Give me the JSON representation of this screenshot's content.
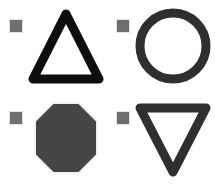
{
  "canvas": {
    "background_color": "#ffffff",
    "width": 215,
    "height": 184,
    "layout": "2x2-grid"
  },
  "palette": {
    "black": "#0d0d0d",
    "dark_gray": "#2f2f2f",
    "fill_gray": "#454545",
    "handle_gray": "#6e6e6e",
    "handle_border": "#e4e4e4",
    "shape_outline_light": "#f2f2f2"
  },
  "items": [
    {
      "id": "triangle-up",
      "icon_name": "triangle-up-outline-icon",
      "handle_name": "selection-handle",
      "label": "",
      "stroke_color": "#0d0d0d",
      "fill_color": "none",
      "stroke_width": 9,
      "sides": 3,
      "rotation_deg": 0
    },
    {
      "id": "circle",
      "icon_name": "circle-outline-icon",
      "handle_name": "selection-handle",
      "label": "",
      "stroke_color": "#2f2f2f",
      "fill_color": "none",
      "stroke_width": 9,
      "sides": 0,
      "rotation_deg": 0
    },
    {
      "id": "octagon",
      "icon_name": "octagon-filled-icon",
      "handle_name": "selection-handle",
      "label": "",
      "stroke_color": "#f2f2f2",
      "fill_color": "#454545",
      "stroke_width": 2,
      "sides": 8,
      "rotation_deg": 22.5
    },
    {
      "id": "triangle-down",
      "icon_name": "triangle-down-outline-icon",
      "handle_name": "selection-handle",
      "label": "",
      "stroke_color": "#2f2f2f",
      "fill_color": "none",
      "stroke_width": 9,
      "sides": 3,
      "rotation_deg": 180
    }
  ]
}
